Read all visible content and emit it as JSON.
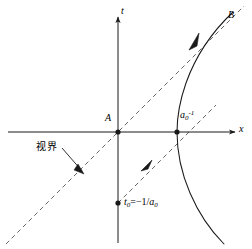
{
  "figure": {
    "background_color": "#ffffff",
    "stroke_color": "#1a1a1a",
    "width": 252,
    "height": 249
  },
  "axes": {
    "t_label": "t",
    "x_label": "x",
    "origin_x": 118,
    "origin_y": 132,
    "t_axis_top": 16,
    "t_axis_bottom": 243,
    "x_axis_left": 8,
    "x_axis_right": 236
  },
  "points": [
    {
      "name": "origin-point-A",
      "label": "A",
      "x": 118,
      "y": 132
    },
    {
      "name": "vertex-point",
      "label": "a0inv",
      "x": 177,
      "y": 132
    },
    {
      "name": "t0-point",
      "label": "t0",
      "x": 118,
      "y": 203
    }
  ],
  "labels": {
    "point_a": "A",
    "point_b": "B",
    "vertex_base": "a",
    "vertex_sub": "0",
    "vertex_sup": "-1",
    "t0_var": "t",
    "t0_sub": "0",
    "t0_eq": "=−1/",
    "t0_a": "a",
    "t0_a_sub": "0",
    "horizon": "视界"
  },
  "curves": [
    {
      "name": "worldline-hyperbola",
      "style": "solid",
      "description": "Hyperbolic worldline of uniformly accelerated observer, vertex at a0^-1"
    },
    {
      "name": "horizon-asymptote-line",
      "style": "dashed",
      "description": "Rindler horizon through origin A at 45 degrees"
    },
    {
      "name": "lower-asymptote-line",
      "style": "dashed",
      "description": "Dashed null line from t0 through the hyperbola vertex"
    }
  ],
  "annotations": [
    {
      "name": "horizon-leader-line",
      "from_x": 62,
      "from_y": 148,
      "to_x": 84,
      "to_y": 173
    }
  ],
  "arrows": [
    {
      "name": "worldline-direction-arrow",
      "x": 196,
      "y": 41
    },
    {
      "name": "lower-null-direction-arrow",
      "x": 146,
      "y": 166
    }
  ]
}
